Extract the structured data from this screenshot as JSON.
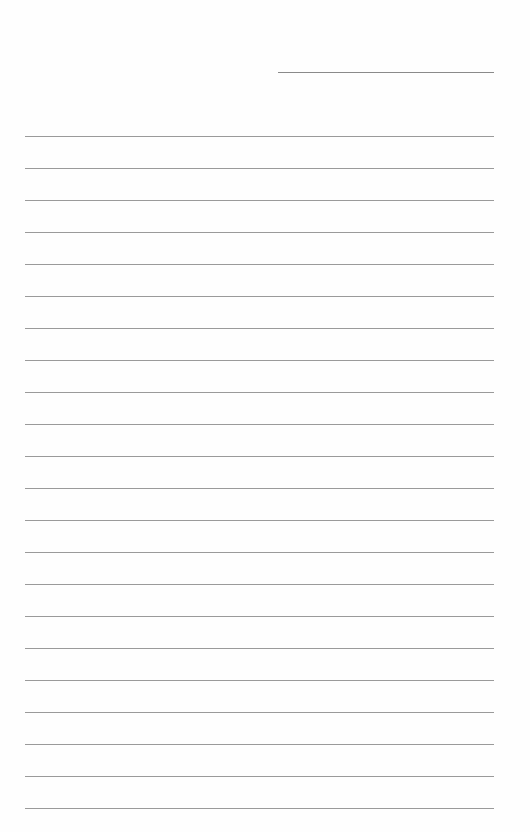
{
  "document": {
    "type": "lined-paper",
    "header_line": {
      "present": true
    },
    "rule_count": 22,
    "rule_start_y": 136,
    "rule_spacing": 32,
    "rule_color": "#9a9a9a",
    "background_color": "#fefefe"
  }
}
